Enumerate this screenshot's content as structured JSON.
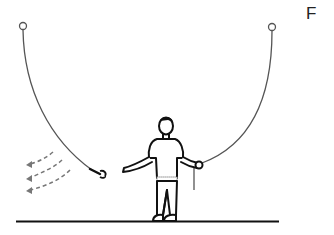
{
  "figure": {
    "panel_label": "F",
    "colors": {
      "rope": "#555555",
      "outline": "#111111",
      "arrows": "#777777",
      "ground": "#111111",
      "background": "#ffffff"
    },
    "elements": {
      "left_anchor": "hook-ring",
      "right_anchor": "hook-ring",
      "left_rope_end": "wrench-icon",
      "right_rope_end": "hand-holding-rope",
      "motion": "dashed-arrows-left",
      "arrow_count": 3
    }
  }
}
